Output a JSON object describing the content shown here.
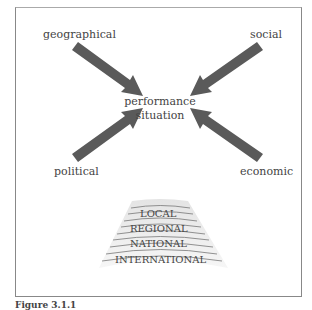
{
  "diagram": {
    "factors": [
      {
        "label": "geographical",
        "position": "top-left"
      },
      {
        "label": "social",
        "position": "top-right"
      },
      {
        "label": "political",
        "position": "bottom-left"
      },
      {
        "label": "economic",
        "position": "bottom-right"
      }
    ],
    "center": {
      "line1": "performance",
      "line2": "situation"
    },
    "levels": [
      "LOCAL",
      "REGIONAL",
      "NATIONAL",
      "INTERNATIONAL"
    ],
    "arrow_color": "#5a5a5a"
  },
  "caption": "Figure 3.1.1"
}
